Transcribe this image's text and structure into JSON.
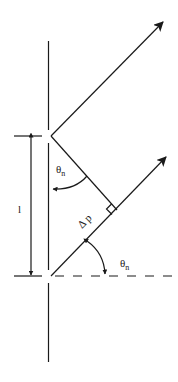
{
  "diagram": {
    "type": "grating-diffraction-geometry",
    "colors": {
      "background": "#ffffff",
      "stroke": "#1a1a1a"
    },
    "labels": {
      "spacing": "l",
      "angle_upper": "θ",
      "angle_upper_sub": "n",
      "path_difference": "Δ p",
      "angle_lower": "θ",
      "angle_lower_sub": "n"
    },
    "elements": [
      "grating-wall with two slits",
      "upper diffracted ray (arrow)",
      "lower diffracted ray (arrow)",
      "perpendicular from upper slit to lower ray",
      "right-angle marker",
      "spacing dimension arrow l",
      "dashed normal reference line",
      "angle arcs θn (two)"
    ]
  }
}
